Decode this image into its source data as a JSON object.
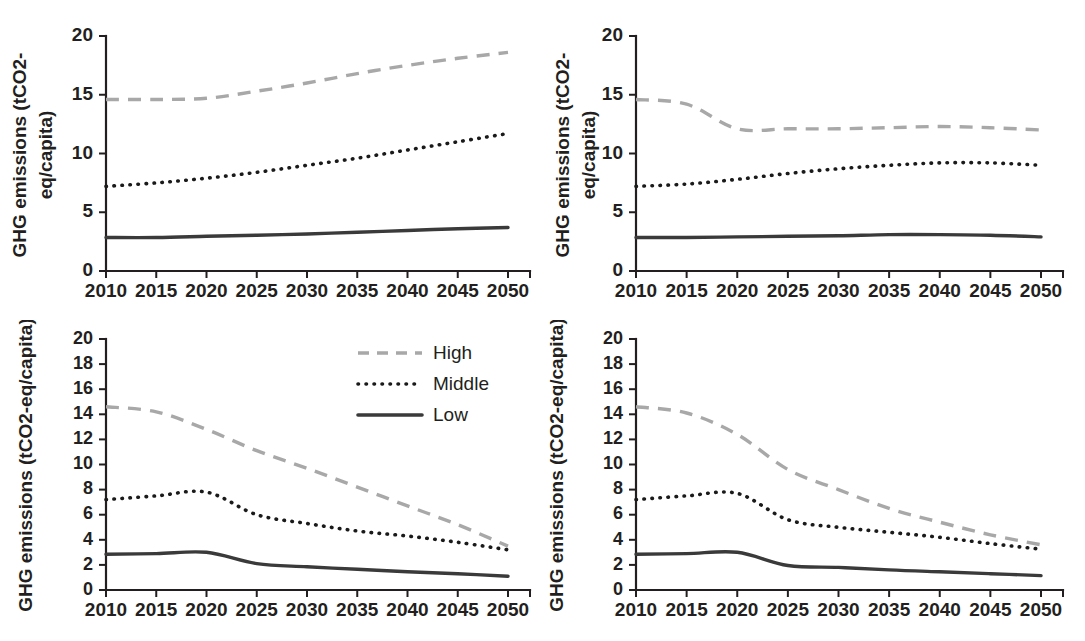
{
  "figure": {
    "background_color": "#ffffff",
    "panel_count": 4
  },
  "legend": {
    "position": "upper-right of bottom-left panel",
    "entries": [
      {
        "label": "High",
        "style": "dashed",
        "color": "#a8a8a8"
      },
      {
        "label": "Middle",
        "style": "dotted",
        "color": "#1a1a1a"
      },
      {
        "label": "Low",
        "style": "solid",
        "color": "#3a3a3a"
      }
    ]
  },
  "chart_data": [
    {
      "panel": "top-left",
      "type": "line",
      "title": "",
      "xlabel": "",
      "ylabel": "GHG emissions (tCO2-eq/capita)",
      "ylabel_lines": [
        "GHG emissions (tCO2-",
        "eq/capita)"
      ],
      "x": [
        2010,
        2015,
        2020,
        2025,
        2030,
        2035,
        2040,
        2045,
        2050
      ],
      "xticklabels": [
        "2010",
        "2015",
        "2020",
        "2025",
        "2030",
        "2035",
        "2040",
        "2045",
        "2050"
      ],
      "xlim": [
        2008,
        2052
      ],
      "ylim": [
        0,
        20
      ],
      "yticks": [
        0,
        5,
        10,
        15,
        20
      ],
      "yticklabels": [
        "0",
        "5",
        "10",
        "15",
        "20"
      ],
      "grid": false,
      "series": [
        {
          "name": "High",
          "values": [
            14.6,
            14.6,
            14.7,
            15.3,
            16.0,
            16.8,
            17.5,
            18.1,
            18.6
          ]
        },
        {
          "name": "Middle",
          "values": [
            7.2,
            7.5,
            7.9,
            8.4,
            9.0,
            9.6,
            10.3,
            11.0,
            11.7
          ]
        },
        {
          "name": "Low",
          "values": [
            2.85,
            2.85,
            2.95,
            3.05,
            3.15,
            3.3,
            3.45,
            3.6,
            3.7
          ]
        }
      ]
    },
    {
      "panel": "top-right",
      "type": "line",
      "title": "",
      "xlabel": "",
      "ylabel": "GHG emissions (tCO2-eq/capita)",
      "ylabel_lines": [
        "GHG emissions (tCO2-",
        "eq/capita)"
      ],
      "x": [
        2010,
        2015,
        2020,
        2025,
        2030,
        2035,
        2040,
        2045,
        2050
      ],
      "xticklabels": [
        "2010",
        "2015",
        "2020",
        "2025",
        "2030",
        "2035",
        "2040",
        "2045",
        "2050"
      ],
      "xlim": [
        2008,
        2052
      ],
      "ylim": [
        0,
        20
      ],
      "yticks": [
        0,
        5,
        10,
        15,
        20
      ],
      "yticklabels": [
        "0",
        "5",
        "10",
        "15",
        "20"
      ],
      "grid": false,
      "series": [
        {
          "name": "High",
          "values": [
            14.6,
            14.2,
            12.1,
            12.1,
            12.1,
            12.2,
            12.3,
            12.2,
            12.0
          ]
        },
        {
          "name": "Middle",
          "values": [
            7.2,
            7.4,
            7.8,
            8.3,
            8.7,
            9.0,
            9.2,
            9.2,
            9.0
          ]
        },
        {
          "name": "Low",
          "values": [
            2.85,
            2.85,
            2.9,
            2.95,
            3.0,
            3.1,
            3.1,
            3.05,
            2.9
          ]
        }
      ]
    },
    {
      "panel": "bottom-left",
      "type": "line",
      "title": "",
      "xlabel": "",
      "ylabel": "GHG emissions (tCO2-eq/capita)",
      "x": [
        2010,
        2015,
        2020,
        2025,
        2030,
        2035,
        2040,
        2045,
        2050
      ],
      "xticklabels": [
        "2010",
        "2015",
        "2020",
        "2025",
        "2030",
        "2035",
        "2040",
        "2045",
        "2050"
      ],
      "xlim": [
        2008,
        2052
      ],
      "ylim": [
        0,
        20
      ],
      "yticks": [
        0,
        2,
        4,
        6,
        8,
        10,
        12,
        14,
        16,
        18,
        20
      ],
      "yticklabels": [
        "0",
        "2",
        "4",
        "6",
        "8",
        "10",
        "12",
        "14",
        "16",
        "18",
        "20"
      ],
      "grid": false,
      "series": [
        {
          "name": "High",
          "values": [
            14.6,
            14.2,
            12.8,
            11.1,
            9.7,
            8.2,
            6.7,
            5.2,
            3.5
          ]
        },
        {
          "name": "Middle",
          "values": [
            7.2,
            7.5,
            7.8,
            6.0,
            5.3,
            4.7,
            4.3,
            3.8,
            3.2
          ]
        },
        {
          "name": "Low",
          "values": [
            2.85,
            2.9,
            3.0,
            2.1,
            1.85,
            1.65,
            1.45,
            1.3,
            1.1
          ]
        }
      ]
    },
    {
      "panel": "bottom-right",
      "type": "line",
      "title": "",
      "xlabel": "",
      "ylabel": "GHG emissions (tCO2-eq/capita)",
      "x": [
        2010,
        2015,
        2020,
        2025,
        2030,
        2035,
        2040,
        2045,
        2050
      ],
      "xticklabels": [
        "2010",
        "2015",
        "2020",
        "2025",
        "2030",
        "2035",
        "2040",
        "2045",
        "2050"
      ],
      "xlim": [
        2008,
        2052
      ],
      "ylim": [
        0,
        20
      ],
      "yticks": [
        0,
        2,
        4,
        6,
        8,
        10,
        12,
        14,
        16,
        18,
        20
      ],
      "yticklabels": [
        "0",
        "2",
        "4",
        "6",
        "8",
        "10",
        "12",
        "14",
        "16",
        "18",
        "20"
      ],
      "grid": false,
      "series": [
        {
          "name": "High",
          "values": [
            14.6,
            14.1,
            12.4,
            9.6,
            8.0,
            6.5,
            5.4,
            4.4,
            3.6
          ]
        },
        {
          "name": "Middle",
          "values": [
            7.2,
            7.5,
            7.7,
            5.6,
            5.0,
            4.6,
            4.2,
            3.7,
            3.25
          ]
        },
        {
          "name": "Low",
          "values": [
            2.85,
            2.9,
            3.0,
            1.95,
            1.8,
            1.6,
            1.45,
            1.3,
            1.15
          ]
        }
      ]
    }
  ]
}
